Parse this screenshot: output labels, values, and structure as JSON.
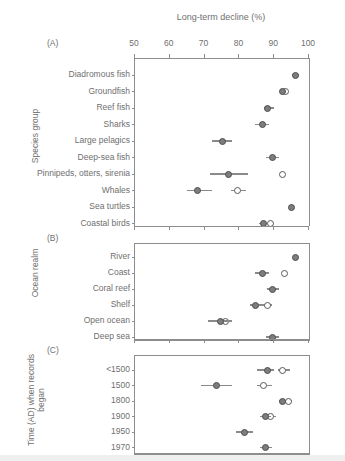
{
  "figure": {
    "axis_title": "Long-term decline (%)",
    "x_ticks": [
      50,
      60,
      70,
      80,
      90,
      100
    ],
    "xlim": [
      50,
      100
    ]
  },
  "panels": [
    {
      "letter": "(A)",
      "group_axis_label": "Species group",
      "rows": [
        {
          "label": "Diadromous fish",
          "filled": 96.0,
          "filled_lo": 95.0,
          "filled_hi": 97.0,
          "open": null,
          "open_lo": null,
          "open_hi": null
        },
        {
          "label": "Groundfish",
          "filled": 92.5,
          "filled_lo": 92.0,
          "filled_hi": 93.5,
          "open": 93.2,
          "open_lo": 92.6,
          "open_hi": 94.0
        },
        {
          "label": "Reef fish",
          "filled": 88.0,
          "filled_lo": 87.0,
          "filled_hi": 90.0,
          "open": null,
          "open_lo": null,
          "open_hi": null
        },
        {
          "label": "Sharks",
          "filled": 86.5,
          "filled_lo": 84.5,
          "filled_hi": 88.5,
          "open": null,
          "open_lo": null,
          "open_hi": null
        },
        {
          "label": "Large pelagics",
          "filled": 75.0,
          "filled_lo": 72.0,
          "filled_hi": 78.0,
          "open": null,
          "open_lo": null,
          "open_hi": null
        },
        {
          "label": "Deep-sea fish",
          "filled": 89.5,
          "filled_lo": 87.5,
          "filled_hi": 91.5,
          "open": null,
          "open_lo": null,
          "open_hi": null
        },
        {
          "label": "Pinnipeds, otters, sirenia",
          "filled": 77.0,
          "filled_lo": 71.5,
          "filled_hi": 82.5,
          "open": 92.5,
          "open_lo": 92.5,
          "open_hi": 92.5
        },
        {
          "label": "Whales",
          "filled": 68.0,
          "filled_lo": 65.0,
          "filled_hi": 72.0,
          "open": 79.5,
          "open_lo": 77.5,
          "open_hi": 82.0
        },
        {
          "label": "Sea turtles",
          "filled": 95.0,
          "filled_lo": 95.0,
          "filled_hi": 95.0,
          "open": null,
          "open_lo": null,
          "open_hi": null
        },
        {
          "label": "Coastal birds",
          "filled": 87.0,
          "filled_lo": 85.5,
          "filled_hi": 88.0,
          "open": 89.0,
          "open_lo": 88.0,
          "open_hi": 90.0
        }
      ]
    },
    {
      "letter": "(B)",
      "group_axis_label": "Ocean realm",
      "rows": [
        {
          "label": "River",
          "filled": 96.0,
          "filled_lo": 96.0,
          "filled_hi": 96.0,
          "open": null,
          "open_lo": null,
          "open_hi": null
        },
        {
          "label": "Coast",
          "filled": 86.5,
          "filled_lo": 84.5,
          "filled_hi": 88.5,
          "open": 93.0,
          "open_lo": 93.0,
          "open_hi": 93.0
        },
        {
          "label": "Coral reef",
          "filled": 89.5,
          "filled_lo": 88.0,
          "filled_hi": 91.5,
          "open": null,
          "open_lo": null,
          "open_hi": null
        },
        {
          "label": "Shelf",
          "filled": 84.5,
          "filled_lo": 83.0,
          "filled_hi": 86.5,
          "open": 88.0,
          "open_lo": 86.5,
          "open_hi": 89.5
        },
        {
          "label": "Open ocean",
          "filled": 74.5,
          "filled_lo": 71.0,
          "filled_hi": 78.0,
          "open": 76.0,
          "open_lo": 76.0,
          "open_hi": 76.0
        },
        {
          "label": "Deep sea",
          "filled": 89.5,
          "filled_lo": 87.5,
          "filled_hi": 91.5,
          "open": null,
          "open_lo": null,
          "open_hi": null
        }
      ]
    },
    {
      "letter": "(C)",
      "group_axis_label": "Time (AD) when records began",
      "rows": [
        {
          "label": "<1500",
          "filled": 88.0,
          "filled_lo": 85.0,
          "filled_hi": 90.0,
          "open": 92.5,
          "open_lo": 91.0,
          "open_hi": 94.5
        },
        {
          "label": "1500",
          "filled": 73.5,
          "filled_lo": 69.0,
          "filled_hi": 78.0,
          "open": 87.0,
          "open_lo": 85.0,
          "open_hi": 89.5
        },
        {
          "label": "1800",
          "filled": 92.5,
          "filled_lo": 91.5,
          "filled_hi": 93.5,
          "open": 94.0,
          "open_lo": 93.0,
          "open_hi": 95.0
        },
        {
          "label": "1900",
          "filled": 87.5,
          "filled_lo": 86.0,
          "filled_hi": 89.0,
          "open": 89.0,
          "open_lo": 88.0,
          "open_hi": 90.5
        },
        {
          "label": "1950",
          "filled": 81.5,
          "filled_lo": 79.0,
          "filled_hi": 84.0,
          "open": null,
          "open_lo": null,
          "open_hi": null
        },
        {
          "label": "1970",
          "filled": 87.5,
          "filled_lo": 86.0,
          "filled_hi": 89.5,
          "open": null,
          "open_lo": null,
          "open_hi": null
        }
      ]
    }
  ],
  "chart_data": {
    "type": "scatter",
    "title": "Long-term decline (%)",
    "xlabel": "Long-term decline (%)",
    "ylabel": "",
    "xlim": [
      50,
      100
    ],
    "xticks": [
      50,
      60,
      70,
      80,
      90,
      100
    ],
    "grid": false,
    "legend": [],
    "note": "Dot-and-whisker (point estimate with range) chart; filled circles and open circles are two marker series repeated per category row.",
    "panels": [
      {
        "panel": "(A)",
        "ylabel": "Species group",
        "categories": [
          "Diadromous fish",
          "Groundfish",
          "Reef fish",
          "Sharks",
          "Large pelagics",
          "Deep-sea fish",
          "Pinnipeds, otters, sirenia",
          "Whales",
          "Sea turtles",
          "Coastal birds"
        ],
        "series": [
          {
            "name": "filled",
            "values": [
              96.0,
              92.5,
              88.0,
              86.5,
              75.0,
              89.5,
              77.0,
              68.0,
              95.0,
              87.0
            ],
            "lo": [
              95.0,
              92.0,
              87.0,
              84.5,
              72.0,
              87.5,
              71.5,
              65.0,
              95.0,
              85.5
            ],
            "hi": [
              97.0,
              93.5,
              90.0,
              88.5,
              78.0,
              91.5,
              82.5,
              72.0,
              95.0,
              88.0
            ]
          },
          {
            "name": "open",
            "values": [
              null,
              93.2,
              null,
              null,
              null,
              null,
              92.5,
              79.5,
              null,
              89.0
            ],
            "lo": [
              null,
              92.6,
              null,
              null,
              null,
              null,
              92.5,
              77.5,
              null,
              88.0
            ],
            "hi": [
              null,
              94.0,
              null,
              null,
              null,
              null,
              92.5,
              82.0,
              null,
              90.0
            ]
          }
        ]
      },
      {
        "panel": "(B)",
        "ylabel": "Ocean realm",
        "categories": [
          "River",
          "Coast",
          "Coral reef",
          "Shelf",
          "Open ocean",
          "Deep sea"
        ],
        "series": [
          {
            "name": "filled",
            "values": [
              96.0,
              86.5,
              89.5,
              84.5,
              74.5,
              89.5
            ],
            "lo": [
              96.0,
              84.5,
              88.0,
              83.0,
              71.0,
              87.5
            ],
            "hi": [
              96.0,
              88.5,
              91.5,
              86.5,
              78.0,
              91.5
            ]
          },
          {
            "name": "open",
            "values": [
              null,
              93.0,
              null,
              88.0,
              76.0,
              null
            ],
            "lo": [
              null,
              93.0,
              null,
              86.5,
              76.0,
              null
            ],
            "hi": [
              null,
              93.0,
              null,
              89.5,
              76.0,
              null
            ]
          }
        ]
      },
      {
        "panel": "(C)",
        "ylabel": "Time (AD) when records began",
        "categories": [
          "<1500",
          "1500",
          "1800",
          "1900",
          "1950",
          "1970"
        ],
        "series": [
          {
            "name": "filled",
            "values": [
              88.0,
              73.5,
              92.5,
              87.5,
              81.5,
              87.5
            ],
            "lo": [
              85.0,
              69.0,
              91.5,
              86.0,
              79.0,
              86.0
            ],
            "hi": [
              90.0,
              78.0,
              93.5,
              89.0,
              84.0,
              89.5
            ]
          },
          {
            "name": "open",
            "values": [
              92.5,
              87.0,
              94.0,
              89.0,
              null,
              null
            ],
            "lo": [
              91.0,
              85.0,
              93.0,
              88.0,
              null,
              null
            ],
            "hi": [
              94.5,
              89.5,
              95.0,
              90.5,
              null,
              null
            ]
          }
        ]
      }
    ]
  }
}
